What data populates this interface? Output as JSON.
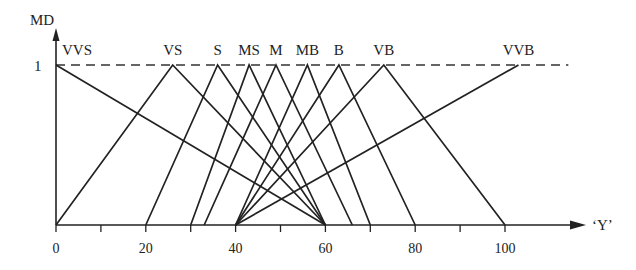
{
  "chart_data": {
    "type": "line",
    "title": "",
    "xlabel": "‘Y’",
    "ylabel": "MD",
    "xlim": [
      0,
      115
    ],
    "ylim": [
      0,
      1
    ],
    "x_ticks": [
      0,
      10,
      20,
      30,
      40,
      50,
      60,
      70,
      80,
      90,
      100
    ],
    "x_tick_labels": [
      "0",
      "20",
      "40",
      "60",
      "80",
      "100"
    ],
    "x_tick_label_values": [
      0,
      20,
      40,
      60,
      80,
      100
    ],
    "y_tick_labels": [
      "1"
    ],
    "reference_line": {
      "y": 1,
      "style": "dashed",
      "x_end": 115
    },
    "grid": false,
    "legend": "labels above peaks",
    "series": [
      {
        "name": "VVS",
        "points": [
          [
            0,
            1
          ],
          [
            60,
            0
          ]
        ]
      },
      {
        "name": "VS",
        "points": [
          [
            0,
            0
          ],
          [
            26,
            1
          ],
          [
            60,
            0
          ]
        ]
      },
      {
        "name": "S",
        "points": [
          [
            20,
            0
          ],
          [
            36,
            1
          ],
          [
            60,
            0
          ]
        ]
      },
      {
        "name": "MS",
        "points": [
          [
            30,
            0
          ],
          [
            43,
            1
          ],
          [
            60,
            0
          ]
        ]
      },
      {
        "name": "M",
        "points": [
          [
            33,
            0
          ],
          [
            49,
            1
          ],
          [
            66,
            0
          ]
        ]
      },
      {
        "name": "MB",
        "points": [
          [
            40,
            0
          ],
          [
            56,
            1
          ],
          [
            70,
            0
          ]
        ]
      },
      {
        "name": "B",
        "points": [
          [
            40,
            0
          ],
          [
            63,
            1
          ],
          [
            80,
            0
          ]
        ]
      },
      {
        "name": "VB",
        "points": [
          [
            40,
            0
          ],
          [
            73,
            1
          ],
          [
            100,
            0
          ]
        ]
      },
      {
        "name": "VVB",
        "points": [
          [
            40,
            0
          ],
          [
            103,
            1
          ]
        ]
      }
    ]
  },
  "labels": {
    "y_axis": "MD",
    "x_axis": "‘Y’",
    "y_one": "1"
  }
}
